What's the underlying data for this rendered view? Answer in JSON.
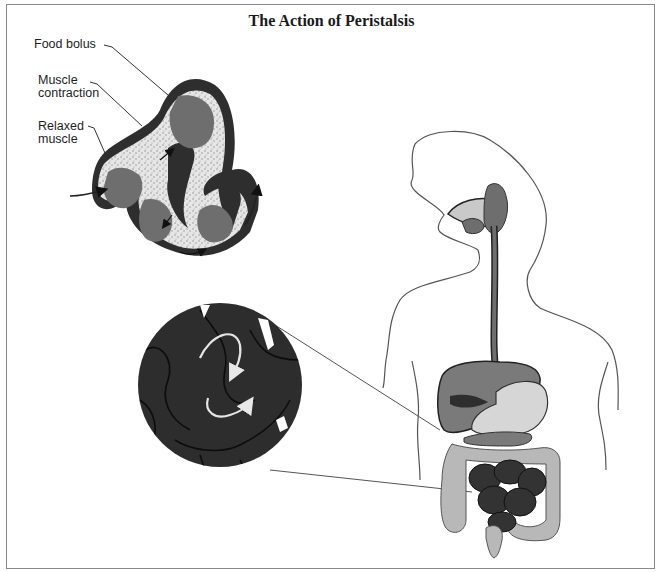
{
  "figure": {
    "title": "The Action of Peristalsis",
    "labels": [
      {
        "id": "food-bolus",
        "lines": [
          "Food bolus"
        ]
      },
      {
        "id": "muscle-contraction",
        "lines": [
          "Muscle",
          "contraction"
        ]
      },
      {
        "id": "relaxed-muscle",
        "lines": [
          "Relaxed",
          "muscle"
        ]
      }
    ],
    "panels": {
      "intestine_section": "cross-section of intestine showing bolus moved by muscle contraction",
      "magnified_view": "magnified circle of small intestine with flow arrows",
      "body": "human upper body silhouette with digestive tract"
    },
    "colors": {
      "muscle_wall": "#2e2e2e",
      "bolus": "#6e6e6e",
      "lining": "#c9c9c9",
      "small_intestine": "#333333",
      "large_intestine": "#b8b8b8",
      "liver": "#7a7a7a",
      "stomach": "#d6d6d6",
      "outline": "#555555",
      "border": "#8a8a8a"
    }
  }
}
